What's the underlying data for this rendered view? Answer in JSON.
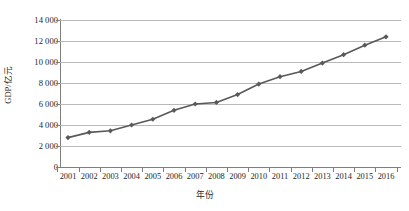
{
  "chart_data": {
    "type": "line",
    "title": "",
    "xlabel": "年份",
    "ylabel": "GDP/亿元",
    "categories": [
      "2001",
      "2002",
      "2003",
      "2004",
      "2005",
      "2006",
      "2007",
      "2008",
      "2009",
      "2010",
      "2011",
      "2012",
      "2013",
      "2014",
      "2015",
      "2016"
    ],
    "values": [
      2800,
      3300,
      3450,
      4000,
      4550,
      5400,
      6000,
      6150,
      6900,
      7900,
      8600,
      9100,
      9900,
      10700,
      11600,
      12400
    ],
    "series": [
      {
        "name": "GDP",
        "values": [
          2800,
          3300,
          3450,
          4000,
          4550,
          5400,
          6000,
          6150,
          6900,
          7900,
          8600,
          9100,
          9900,
          10700,
          11600,
          12400
        ]
      }
    ],
    "ylim": [
      0,
      14000
    ],
    "ytick_labels": [
      "14 000",
      "12 000",
      "10 000",
      "8 000",
      "6 000",
      "4 000",
      "2 000",
      "0"
    ],
    "ytick_values": [
      14000,
      12000,
      10000,
      8000,
      6000,
      4000,
      2000,
      0
    ],
    "ytick_step": 2000,
    "grid": true,
    "grid_axis": "y",
    "legend": false,
    "legend_position": "none",
    "marker": "diamond",
    "series_color": "#595959",
    "grid_color": "#b9b9b9",
    "axis_color": "#7d7d7d"
  }
}
